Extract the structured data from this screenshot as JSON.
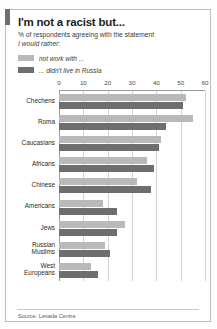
{
  "header": {
    "title": "I'm not a racist but...",
    "subtitle": "% of respondents agreeing with the statement",
    "subtitle_italic": "I would rather:"
  },
  "legend": [
    {
      "label": "not work with ...",
      "color": "#b9b9b9",
      "key": "not_work_with"
    },
    {
      "label": "... didn't live in Russia",
      "color": "#6e6e6e",
      "key": "didnt_live_in_russia"
    }
  ],
  "footer": {
    "source": "Source: Levada Centre"
  },
  "chart_data": {
    "type": "bar",
    "orientation": "horizontal",
    "title": "I'm not a racist but...",
    "subtitle": "% of respondents agreeing with the statement",
    "xlabel": "",
    "ylabel": "",
    "xlim": [
      0,
      60
    ],
    "xticks": [
      0,
      10,
      20,
      30,
      40,
      50,
      60
    ],
    "xtick_labels": [
      "0",
      "10",
      "20",
      "30",
      "40",
      "50",
      "60"
    ],
    "grid": true,
    "legend_position": "top-left",
    "categories": [
      "Chechens",
      "Roma",
      "Caucasians",
      "Africans",
      "Chinese",
      "Americans",
      "Jews",
      "Russian\nMuslims",
      "West\nEuropeans"
    ],
    "series": [
      {
        "name": "not work with ...",
        "color": "#b9b9b9",
        "values": [
          52,
          55,
          42,
          36,
          32,
          18,
          27,
          19,
          13
        ]
      },
      {
        "name": "... didn't live in Russia",
        "color": "#6e6e6e",
        "values": [
          51,
          44,
          41,
          39,
          38,
          24,
          24,
          21,
          16
        ]
      }
    ]
  }
}
